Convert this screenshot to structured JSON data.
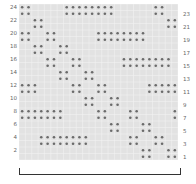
{
  "chart_data": {
    "type": "heatmap",
    "title": "",
    "columns": 25,
    "rows": 24,
    "left_labels": [
      "24",
      "22",
      "20",
      "18",
      "16",
      "14",
      "12",
      "10",
      "8",
      "6",
      "4",
      "2"
    ],
    "right_labels": [
      "23",
      "21",
      "19",
      "17",
      "15",
      "13",
      "11",
      "9",
      "7",
      "5",
      "3",
      "1"
    ],
    "colors": {
      "grid_bg": "#e2e2e2",
      "grid_line": "#f2f2f2",
      "dot": "#6a6a6a",
      "label": "#666666",
      "bracket": "#333333"
    },
    "row_pairs": [
      {
        "rows": [
          24,
          23
        ],
        "cols": [
          0,
          1,
          7,
          8,
          9,
          10,
          11,
          12,
          13,
          14,
          21,
          22
        ]
      },
      {
        "rows": [
          22,
          21
        ],
        "cols": [
          2,
          3,
          23,
          24
        ]
      },
      {
        "rows": [
          20,
          19
        ],
        "cols": [
          0,
          1,
          4,
          5,
          12,
          13,
          14,
          15,
          16,
          17,
          18,
          19
        ]
      },
      {
        "rows": [
          18,
          17
        ],
        "cols": [
          2,
          3,
          6,
          7
        ]
      },
      {
        "rows": [
          16,
          15
        ],
        "cols": [
          4,
          5,
          8,
          9,
          16,
          17,
          18,
          19,
          20,
          21,
          22,
          23
        ]
      },
      {
        "rows": [
          14,
          13
        ],
        "cols": [
          6,
          7,
          10,
          11
        ]
      },
      {
        "rows": [
          12,
          11
        ],
        "cols": [
          0,
          1,
          2,
          8,
          9,
          12,
          13,
          20,
          21,
          22,
          23,
          24
        ]
      },
      {
        "rows": [
          10,
          9
        ],
        "cols": [
          10,
          11,
          14,
          15
        ]
      },
      {
        "rows": [
          8,
          7
        ],
        "cols": [
          0,
          1,
          2,
          3,
          4,
          5,
          6,
          12,
          13,
          17,
          18,
          24
        ]
      },
      {
        "rows": [
          6,
          5
        ],
        "cols": [
          14,
          15,
          19,
          20
        ]
      },
      {
        "rows": [
          4,
          3
        ],
        "cols": [
          3,
          4,
          5,
          6,
          7,
          8,
          9,
          10,
          17,
          18,
          21,
          22
        ]
      },
      {
        "rows": [
          2,
          1
        ],
        "cols": [
          19,
          20,
          23,
          24
        ]
      }
    ]
  }
}
